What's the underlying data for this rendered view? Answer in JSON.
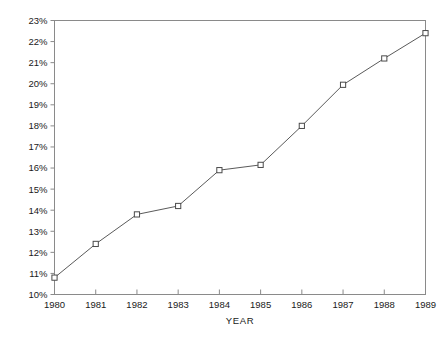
{
  "chart_data": {
    "type": "line",
    "title": "",
    "subtitle": "",
    "xlabel": "YEAR",
    "ylabel": "",
    "categories": [
      "1980",
      "1981",
      "1982",
      "1983",
      "1984",
      "1985",
      "1986",
      "1987",
      "1988",
      "1989"
    ],
    "x": [
      1980,
      1981,
      1982,
      1983,
      1984,
      1985,
      1986,
      1987,
      1988,
      1989
    ],
    "values": [
      10.8,
      12.4,
      13.8,
      14.2,
      15.9,
      16.15,
      18.0,
      19.95,
      21.2,
      22.4
    ],
    "series": [
      {
        "name": "",
        "values": [
          10.8,
          12.4,
          13.8,
          14.2,
          15.9,
          16.15,
          18.0,
          19.95,
          21.2,
          22.4
        ]
      }
    ],
    "ylim": [
      10,
      23
    ],
    "xlim": [
      1980,
      1989
    ],
    "ytick_labels": [
      "10%",
      "11%",
      "12%",
      "13%",
      "14%",
      "15%",
      "16%",
      "17%",
      "18%",
      "19%",
      "20%",
      "21%",
      "22%",
      "23%"
    ],
    "ytick_values": [
      10,
      11,
      12,
      13,
      14,
      15,
      16,
      17,
      18,
      19,
      20,
      21,
      22,
      23
    ],
    "xtick_labels": [
      "1980",
      "1981",
      "1982",
      "1983",
      "1984",
      "1985",
      "1986",
      "1987",
      "1988",
      "1989"
    ],
    "grid": false,
    "legend": "none",
    "marker": "open-square",
    "line_color": "#5a5a5a",
    "marker_color": "#4a4a4a",
    "frame_color": "#8a8a8a",
    "text_color": "#1a1a1a",
    "background": "#ffffff"
  }
}
